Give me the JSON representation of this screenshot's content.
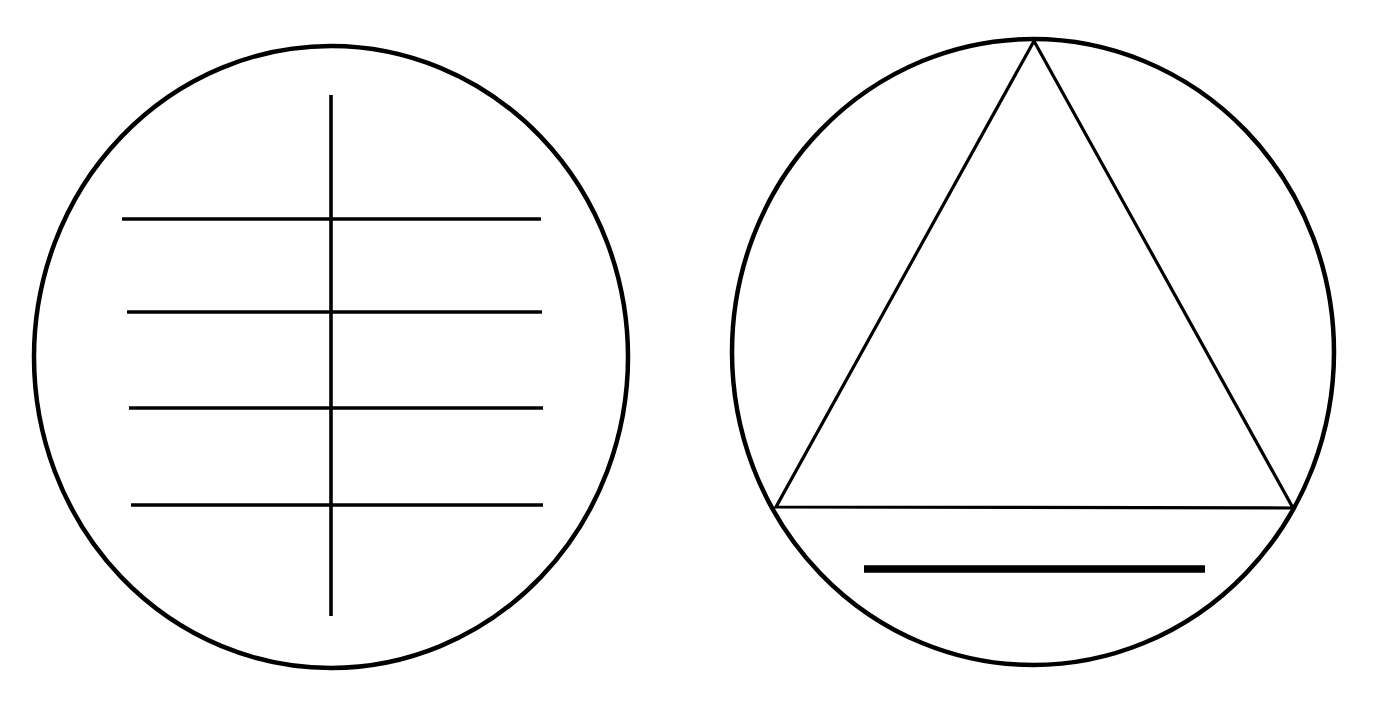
{
  "page": {
    "background_color": "#ffffff",
    "stroke_color": "#000000",
    "width": 1399,
    "height": 713
  },
  "figures": [
    {
      "id": "left-figure",
      "name": "circle-with-crossed-lines",
      "description": "Circle containing one long vertical line crossed by four horizontal lines",
      "circle": {
        "center_x": 331,
        "center_y": 357,
        "radius_x": 297,
        "radius_y": 311,
        "stroke_width": 4.5
      },
      "vertical_line": {
        "x": 331,
        "y_top": 95,
        "y_bottom": 616,
        "stroke_width": 3.6
      },
      "horizontal_lines": [
        {
          "index": 1,
          "y": 219,
          "x_start": 122,
          "x_end": 541,
          "stroke_width": 3.6
        },
        {
          "index": 2,
          "y": 312,
          "x_start": 127,
          "x_end": 542,
          "stroke_width": 3.6
        },
        {
          "index": 3,
          "y": 408,
          "x_start": 129,
          "x_end": 543,
          "stroke_width": 3.6
        },
        {
          "index": 4,
          "y": 505,
          "x_start": 131,
          "x_end": 543,
          "stroke_width": 3.6
        }
      ]
    },
    {
      "id": "right-figure",
      "name": "circle-with-inscribed-triangle",
      "description": "Circle containing an inscribed triangle with apex at top and a thick horizontal bar below the triangle base",
      "circle": {
        "center_x": 1033,
        "center_y": 352,
        "radius_x": 301,
        "radius_y": 313,
        "stroke_width": 4.5
      },
      "triangle": {
        "apex_x": 1034,
        "apex_y": 41,
        "left_x": 776,
        "left_y": 507,
        "right_x": 1293,
        "right_y": 508,
        "stroke_width": 3.2
      },
      "thick_bar": {
        "x_start": 864,
        "x_end": 1205,
        "y": 569,
        "thickness": 7.5
      }
    }
  ]
}
